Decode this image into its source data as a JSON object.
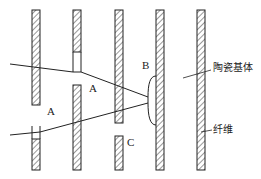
{
  "diagram": {
    "title": "",
    "labels": {
      "A1": "A",
      "A2": "A",
      "B": "B",
      "C": "C"
    },
    "annotations": {
      "matrix": "陶瓷基体",
      "fiber": "纤维"
    },
    "colors": {
      "stroke": "#222222",
      "background": "#ffffff"
    }
  }
}
